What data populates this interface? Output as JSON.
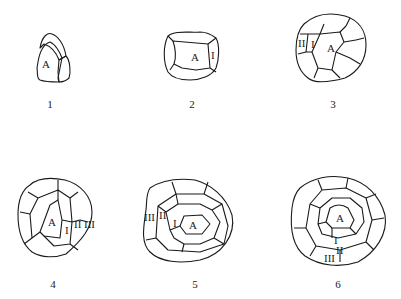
{
  "figure": {
    "stages": [
      {
        "number": "1",
        "labels": [
          "A"
        ]
      },
      {
        "number": "2",
        "labels": [
          "A",
          "I"
        ]
      },
      {
        "number": "3",
        "labels": [
          "A",
          "I",
          "II"
        ]
      },
      {
        "number": "4",
        "labels": [
          "A",
          "I",
          "II",
          "III"
        ]
      },
      {
        "number": "5",
        "labels": [
          "A",
          "I",
          "II",
          "III"
        ]
      },
      {
        "number": "6",
        "labels": [
          "A",
          "I",
          "II",
          "III"
        ]
      }
    ]
  }
}
